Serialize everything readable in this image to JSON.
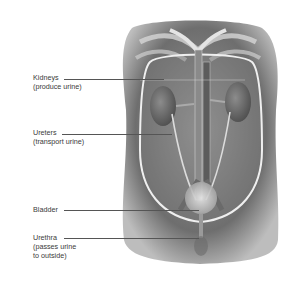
{
  "diagram": {
    "colors": {
      "background": "#ffffff",
      "body_dark": "#5a5a5a",
      "body_mid": "#8a8a8a",
      "body_light": "#c8c8c8",
      "outline": "#eeeeee",
      "label_text": "#3a3a3a",
      "leader_line": "#555555"
    },
    "labels": [
      {
        "name": "Kidneys",
        "description": "(produce urine)"
      },
      {
        "name": "Ureters",
        "description": "(transport urine)"
      },
      {
        "name": "Bladder",
        "description": ""
      },
      {
        "name": "Urethra",
        "description": "(passes urine",
        "description2": "to outside)"
      }
    ]
  }
}
